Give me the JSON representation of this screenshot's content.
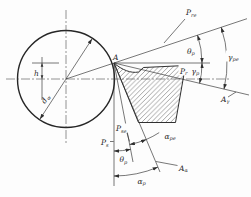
{
  "diagram": {
    "colors": {
      "line": "#2e2e2e",
      "background": "#fdfdfd",
      "hatch": "#4a4a4a"
    },
    "labels": {
      "point_a": {
        "main": "A",
        "sub": ""
      },
      "height_h": {
        "main": "h",
        "sub": ""
      },
      "diameter_dw": {
        "main": "d",
        "sub": "w"
      },
      "p_re": {
        "main": "P",
        "sub": "re"
      },
      "theta_p_top": {
        "main": "θ",
        "sub": "p"
      },
      "gamma_pe": {
        "main": "γ",
        "sub": "pe"
      },
      "p_r": {
        "main": "P",
        "sub": "r"
      },
      "gamma_p": {
        "main": "γ",
        "sub": "p"
      },
      "a_gamma": {
        "main": "A",
        "sub": "γ"
      },
      "p_se": {
        "main": "P",
        "sub": "se"
      },
      "p_s": {
        "main": "P",
        "sub": "s"
      },
      "alpha_pe": {
        "main": "α",
        "sub": "pe"
      },
      "theta_p_bottom": {
        "main": "θ",
        "sub": "p"
      },
      "a_alpha": {
        "main": "A",
        "sub": "α"
      },
      "alpha_p": {
        "main": "α",
        "sub": "p"
      }
    }
  }
}
